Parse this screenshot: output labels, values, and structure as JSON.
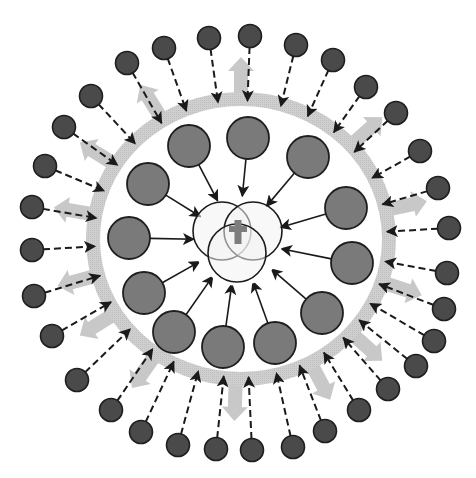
{
  "diagram": {
    "title": "",
    "center": {
      "x": 238,
      "y": 240,
      "symbol": "cross-icon"
    },
    "colors": {
      "background": "#ffffff",
      "outer_dot": "#4a4a4a",
      "middle_circle": "#7a7a7a",
      "ring": "#cfcfcf",
      "gray_arrow": "#c8c8c8",
      "venn_fill": "#f2f2f2",
      "cross": "#7d7d7d",
      "stroke": "#1a1a1a"
    },
    "ring": {
      "cx": 241,
      "cy": 239,
      "rx": 148,
      "ry": 140,
      "width": 14
    },
    "venn_circles": [
      {
        "cx": 222,
        "cy": 231,
        "r": 29
      },
      {
        "cx": 253,
        "cy": 231,
        "r": 29
      },
      {
        "cx": 237,
        "cy": 253,
        "r": 29
      }
    ],
    "middle_circles": [
      {
        "x": 189,
        "y": 146
      },
      {
        "x": 248,
        "y": 138
      },
      {
        "x": 308,
        "y": 157
      },
      {
        "x": 148,
        "y": 184
      },
      {
        "x": 346,
        "y": 208
      },
      {
        "x": 129,
        "y": 238
      },
      {
        "x": 352,
        "y": 263
      },
      {
        "x": 144,
        "y": 293
      },
      {
        "x": 322,
        "y": 313
      },
      {
        "x": 174,
        "y": 332
      },
      {
        "x": 223,
        "y": 347
      },
      {
        "x": 275,
        "y": 343
      }
    ],
    "outer_dots": [
      {
        "x": 127,
        "y": 63
      },
      {
        "x": 164,
        "y": 48
      },
      {
        "x": 209,
        "y": 38
      },
      {
        "x": 250,
        "y": 36
      },
      {
        "x": 296,
        "y": 45
      },
      {
        "x": 333,
        "y": 60
      },
      {
        "x": 366,
        "y": 87
      },
      {
        "x": 396,
        "y": 113
      },
      {
        "x": 420,
        "y": 151
      },
      {
        "x": 438,
        "y": 188
      },
      {
        "x": 449,
        "y": 228
      },
      {
        "x": 447,
        "y": 273
      },
      {
        "x": 444,
        "y": 309
      },
      {
        "x": 434,
        "y": 341
      },
      {
        "x": 416,
        "y": 366
      },
      {
        "x": 388,
        "y": 389
      },
      {
        "x": 359,
        "y": 410
      },
      {
        "x": 325,
        "y": 431
      },
      {
        "x": 293,
        "y": 447
      },
      {
        "x": 252,
        "y": 450
      },
      {
        "x": 216,
        "y": 449
      },
      {
        "x": 178,
        "y": 445
      },
      {
        "x": 141,
        "y": 432
      },
      {
        "x": 111,
        "y": 410
      },
      {
        "x": 77,
        "y": 380
      },
      {
        "x": 52,
        "y": 336
      },
      {
        "x": 34,
        "y": 296
      },
      {
        "x": 32,
        "y": 250
      },
      {
        "x": 32,
        "y": 207
      },
      {
        "x": 45,
        "y": 166
      },
      {
        "x": 64,
        "y": 127
      },
      {
        "x": 91,
        "y": 96
      }
    ],
    "gray_outward_arrows": [
      {
        "angle": -90,
        "label": "outflow-top"
      },
      {
        "angle": -122
      },
      {
        "angle": -148
      },
      {
        "angle": -170
      },
      {
        "angle": 165
      },
      {
        "angle": 148
      },
      {
        "angle": 125
      },
      {
        "angle": 92
      },
      {
        "angle": 62
      },
      {
        "angle": 42
      },
      {
        "angle": 18
      },
      {
        "angle": -12
      },
      {
        "angle": -42
      }
    ]
  }
}
